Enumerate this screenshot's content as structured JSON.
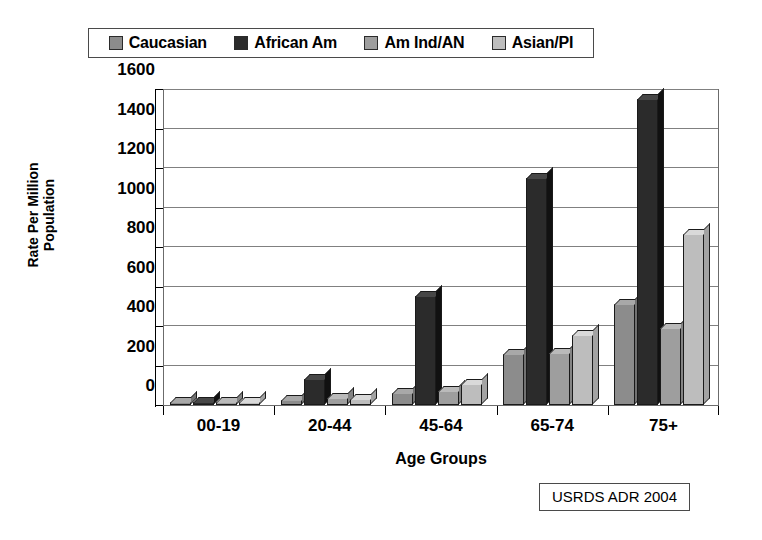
{
  "chart_data": {
    "type": "bar",
    "title": "",
    "subtitle": "",
    "xlabel": "Age Groups",
    "ylabel": "Rate Per Million Population",
    "ylabel_lines": [
      "Rate Per Million",
      "Population"
    ],
    "categories": [
      "00-19",
      "20-44",
      "45-64",
      "65-74",
      "75+"
    ],
    "series": [
      {
        "name": "Caucasian",
        "color": "#8c8c8c",
        "values": [
          5,
          25,
          60,
          260,
          510
        ]
      },
      {
        "name": "African Am",
        "color": "#2b2b2b",
        "values": [
          10,
          130,
          550,
          1150,
          1550
        ]
      },
      {
        "name": "Am Ind/AN",
        "color": "#9e9e9e",
        "values": [
          2,
          35,
          70,
          265,
          390
        ]
      },
      {
        "name": "Asian/PI",
        "color": "#bdbdbd",
        "values": [
          2,
          30,
          105,
          355,
          865
        ]
      }
    ],
    "ylim": [
      0,
      1600
    ],
    "ytick_values": [
      0,
      200,
      400,
      600,
      800,
      1000,
      1200,
      1400,
      1600
    ],
    "ytick_labels": [
      "0",
      "200",
      "400",
      "600",
      "800",
      "1000",
      "1200",
      "1400",
      "1600"
    ],
    "grid": true,
    "grid_axis": "y",
    "legend_position": "top",
    "style_3d": true,
    "annotations": [
      {
        "name": "source-note",
        "text": "USRDS ADR 2004",
        "position": "bottom-right",
        "boxed": true
      }
    ]
  },
  "source_note": {
    "text": "USRDS ADR 2004"
  }
}
